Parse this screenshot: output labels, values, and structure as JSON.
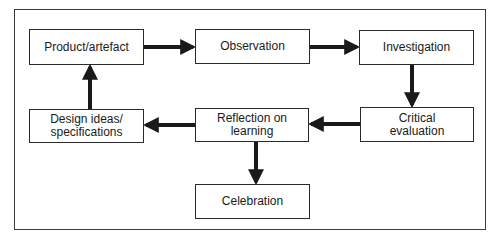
{
  "diagram": {
    "type": "cycle-flowchart",
    "nodes": [
      {
        "id": "product",
        "label": "Product/artefact"
      },
      {
        "id": "observation",
        "label": "Observation"
      },
      {
        "id": "investigation",
        "label": "Investigation"
      },
      {
        "id": "critical",
        "label": "Critical\nevaluation"
      },
      {
        "id": "reflection",
        "label": "Reflection on\nlearning"
      },
      {
        "id": "design",
        "label": "Design ideas/\nspecifications"
      },
      {
        "id": "celebration",
        "label": "Celebration"
      }
    ],
    "edges": [
      {
        "from": "product",
        "to": "observation"
      },
      {
        "from": "observation",
        "to": "investigation"
      },
      {
        "from": "investigation",
        "to": "critical"
      },
      {
        "from": "critical",
        "to": "reflection"
      },
      {
        "from": "reflection",
        "to": "design"
      },
      {
        "from": "design",
        "to": "product"
      },
      {
        "from": "reflection",
        "to": "celebration"
      }
    ],
    "colors": {
      "stroke": "#2a2a2a",
      "text": "#1a1a1a",
      "background": "#ffffff"
    }
  }
}
